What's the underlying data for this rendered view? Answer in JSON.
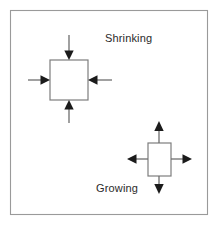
{
  "figure": {
    "canvas": {
      "width": 219,
      "height": 226,
      "background": "#ffffff"
    },
    "frame": {
      "x": 10,
      "y": 10,
      "width": 198,
      "height": 205,
      "stroke": "#9a9a9a"
    },
    "colors": {
      "box_stroke": "#7d7d7d",
      "box_fill": "#ffffff",
      "arrow_line": "#6e6e6e",
      "arrow_head": "#1b1b1b",
      "label_text": "#2a2a2a",
      "frame_stroke": "#9a9a9a",
      "background": "#ffffff"
    },
    "diagrams": [
      {
        "id": "shrinking",
        "label": "Shrinking",
        "label_x": 105,
        "label_y": 42,
        "arrow_direction": "inward",
        "box": {
          "x": 50,
          "y": 60,
          "width": 38,
          "height": 40
        },
        "arrows": [
          {
            "name": "arrow-down-into-top",
            "from_x": 69,
            "from_y": 35,
            "to_x": 69,
            "to_y": 59,
            "points": "down"
          },
          {
            "name": "arrow-right-into-left",
            "from_x": 28,
            "from_y": 80,
            "to_x": 49,
            "to_y": 80,
            "points": "right"
          },
          {
            "name": "arrow-left-into-right",
            "from_x": 112,
            "from_y": 80,
            "to_x": 89,
            "to_y": 80,
            "points": "left"
          },
          {
            "name": "arrow-up-into-bottom",
            "from_x": 69,
            "from_y": 123,
            "to_x": 69,
            "to_y": 101,
            "points": "up"
          }
        ]
      },
      {
        "id": "growing",
        "label": "Growing",
        "label_x": 96,
        "label_y": 192,
        "arrow_direction": "outward",
        "box": {
          "x": 148,
          "y": 143,
          "width": 23,
          "height": 33
        },
        "arrows": [
          {
            "name": "arrow-up-from-top",
            "from_x": 159,
            "from_y": 142,
            "to_x": 159,
            "to_y": 122,
            "points": "up"
          },
          {
            "name": "arrow-left-from-left",
            "from_x": 147,
            "from_y": 159,
            "to_x": 128,
            "to_y": 159,
            "points": "left"
          },
          {
            "name": "arrow-right-from-right",
            "from_x": 172,
            "from_y": 159,
            "to_x": 192,
            "to_y": 159,
            "points": "right"
          },
          {
            "name": "arrow-down-from-bottom",
            "from_x": 159,
            "from_y": 177,
            "to_x": 159,
            "to_y": 193,
            "points": "down"
          }
        ]
      }
    ]
  }
}
